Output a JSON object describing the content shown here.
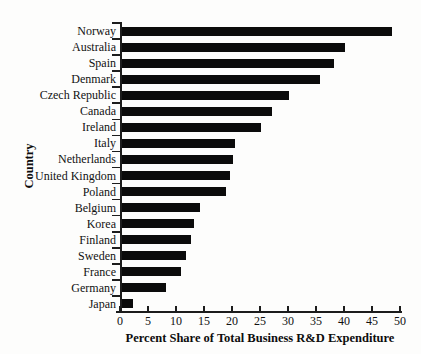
{
  "figure": {
    "background_color": "#fdfdfc",
    "bar_color": "#0b0b0b",
    "axis_color": "#1c1c1c"
  },
  "chart_data": {
    "type": "bar",
    "orientation": "horizontal",
    "title": "",
    "xlabel": "Percent Share of Total Business R&D Expenditure",
    "ylabel": "Country",
    "xlim": [
      0,
      50
    ],
    "x_ticks": [
      0,
      5,
      10,
      15,
      20,
      25,
      30,
      35,
      40,
      45,
      50
    ],
    "grid": false,
    "legend": null,
    "categories": [
      "Norway",
      "Australia",
      "Spain",
      "Denmark",
      "Czech Republic",
      "Canada",
      "Ireland",
      "Italy",
      "Netherlands",
      "United Kingdom",
      "Poland",
      "Belgium",
      "Korea",
      "Finland",
      "Sweden",
      "France",
      "Germany",
      "Japan"
    ],
    "values": [
      48.2,
      39.8,
      37.8,
      35.3,
      29.9,
      26.7,
      24.8,
      20.1,
      19.8,
      19.2,
      18.6,
      13.9,
      12.8,
      12.4,
      11.4,
      10.6,
      7.9,
      2.0
    ]
  }
}
